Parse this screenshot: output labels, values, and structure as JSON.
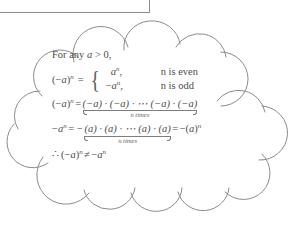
{
  "figure": {
    "kind": "cloud-callout",
    "colors": {
      "stroke": "#8b8b8b",
      "text": "#4c4c4c",
      "background": "#ffffff",
      "rule": "#7d7d7d"
    }
  },
  "box_fragment": {
    "name": "partial-rectangle-border"
  },
  "content": {
    "intro": {
      "prefix": "For any ",
      "variable": "a",
      "relation": " > 0,"
    },
    "cases": {
      "lhs_open": "(−",
      "lhs_var": "a",
      "lhs_close": ")",
      "lhs_exp": "n",
      "equals": "=",
      "brace": "{",
      "rows": [
        {
          "value_sign": "",
          "value_var": "a",
          "value_exp": "n",
          "value_comma": ",",
          "condition": "n is even"
        },
        {
          "value_sign": "−",
          "value_var": "a",
          "value_exp": "n",
          "value_comma": ",",
          "condition": "n is odd"
        }
      ]
    },
    "expand": {
      "lhs_open": "(−",
      "lhs_var": "a",
      "lhs_close": ")",
      "lhs_exp": "n",
      "equals": "=",
      "factors": "(−a) · (−a) · ⋯ (−a) · (−a)",
      "underbrace_label": "n times"
    },
    "negative": {
      "lhs_sign": "−",
      "lhs_var": "a",
      "lhs_exp": "n",
      "equals": "=",
      "minus": "−",
      "factors": "(a) · (a) · ⋯ (a) · (a)",
      "underbrace_label": "n times",
      "equals2": "=",
      "result_sign": "−",
      "result_open": "(",
      "result_var": "a",
      "result_close": ")",
      "result_exp": "n"
    },
    "conclusion": {
      "therefore": "∴",
      "left_open": "(−",
      "left_var": "a",
      "left_close": ")",
      "left_exp": "n",
      "relation": "≠",
      "right_sign": "−",
      "right_var": "a",
      "right_exp": "n"
    }
  }
}
